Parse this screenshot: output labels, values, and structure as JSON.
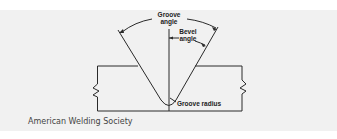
{
  "diagram": {
    "labels": {
      "groove_angle_line1": "Groove",
      "groove_angle_line2": "angle",
      "bevel_angle_line1": "Bevel",
      "bevel_angle_line2": "angle",
      "groove_radius": "Groove radius"
    },
    "credit": "American Welding Society"
  }
}
